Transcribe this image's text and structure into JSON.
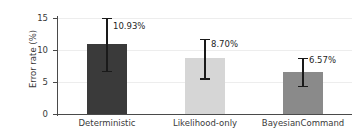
{
  "chart_data": {
    "type": "bar",
    "title": "",
    "xlabel": "",
    "ylabel": "Error rate (%)",
    "categories": [
      "Deterministic",
      "Likelihood-only",
      "BayesianCommand"
    ],
    "values": [
      10.93,
      8.7,
      6.57
    ],
    "value_labels": [
      "10.93%",
      "8.70%",
      "6.57%"
    ],
    "errors_low": [
      6.75,
      5.55,
      4.35
    ],
    "errors_high": [
      15.0,
      11.75,
      8.8
    ],
    "bar_colors": [
      "#3a3a3a",
      "#d6d6d6",
      "#8a8a8a"
    ],
    "ylim": [
      0,
      15.6
    ],
    "yticks": [
      0,
      5,
      10,
      15
    ],
    "ytick_labels": [
      "0",
      "5",
      "10",
      "15"
    ],
    "grid": "horizontal-only",
    "legend": "none",
    "error_bar_color": "#1a1a1a",
    "axis_color": "#4a4a4a",
    "gridline_color": "#ededed"
  }
}
